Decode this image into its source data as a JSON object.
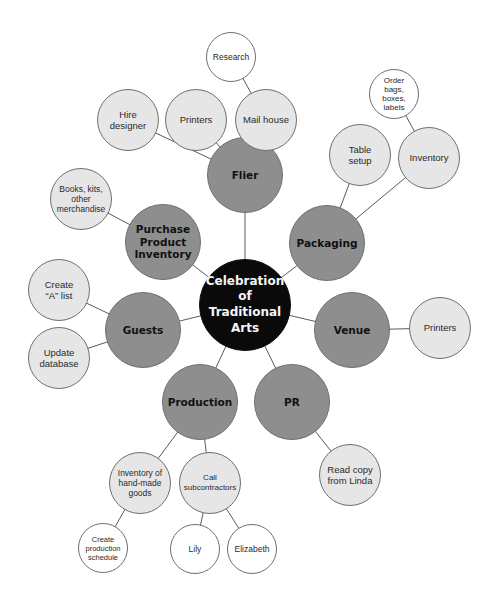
{
  "diagram": {
    "center": {
      "label": "Celebration of Traditional Arts"
    },
    "main_nodes": {
      "flier": "Flier",
      "packaging": "Packaging",
      "venue": "Venue",
      "pr": "PR",
      "production": "Production",
      "guests": "Guests",
      "purchase": "Purchase Product Inventory"
    },
    "sub_nodes": {
      "hire_designer": "Hire designer",
      "printers_flier": "Printers",
      "mail_house": "Mail house",
      "table_setup": "Table setup",
      "inventory_packaging": "Inventory",
      "books_kits": "Books, kits, other merchandise",
      "create_a_list": "Create “A” list",
      "update_database": "Update database",
      "printers_venue": "Printers",
      "read_copy": "Read copy from Linda",
      "inventory_handmade": "Inventory of hand-made goods",
      "call_subcontractors": "Call subcontractors"
    },
    "leaf_nodes": {
      "research": "Research",
      "order_bags": "Order bags, boxes, labels",
      "create_schedule": "Create production schedule",
      "lily": "Lily",
      "elizabeth": "Elizabeth"
    },
    "colors": {
      "center_fill": "#0a0a0a",
      "main_fill": "#8e8e8e",
      "sub_fill": "#e6e6e6",
      "leaf_fill": "#ffffff",
      "line": "#5a5a5a"
    }
  }
}
